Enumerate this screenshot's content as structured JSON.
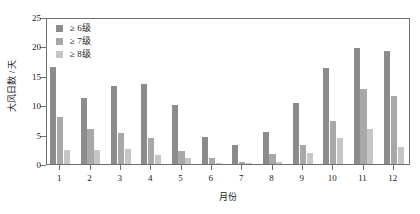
{
  "chart_data": {
    "type": "bar",
    "title": "",
    "xlabel": "月份",
    "ylabel": "大风日数 / 天",
    "categories": [
      "1",
      "2",
      "3",
      "4",
      "5",
      "6",
      "7",
      "8",
      "9",
      "10",
      "11",
      "12"
    ],
    "ylim": [
      0,
      25
    ],
    "yticks": [
      0,
      5,
      10,
      15,
      20,
      25
    ],
    "grid": false,
    "legend_position": "top-left",
    "series": [
      {
        "name": "≥ 6级",
        "color": "#8c8c8c",
        "values": [
          16.5,
          11.2,
          13.2,
          13.6,
          10.0,
          4.6,
          3.2,
          5.5,
          10.4,
          16.3,
          19.7,
          19.2
        ]
      },
      {
        "name": "≥ 7级",
        "color": "#a8a8a8",
        "values": [
          8.0,
          6.0,
          5.3,
          4.5,
          2.2,
          1.1,
          0.3,
          1.7,
          3.2,
          7.3,
          12.7,
          11.5
        ]
      },
      {
        "name": "≥ 8级",
        "color": "#c6c6c6",
        "values": [
          2.3,
          2.4,
          2.5,
          1.6,
          1.0,
          0.2,
          0.1,
          0.4,
          1.8,
          4.4,
          6.0,
          2.9
        ]
      }
    ]
  },
  "axis": {
    "y_tick_labels": [
      "0",
      "5",
      "10",
      "15",
      "20",
      "25"
    ],
    "x_tick_labels": [
      "1",
      "2",
      "3",
      "4",
      "5",
      "6",
      "7",
      "8",
      "9",
      "10",
      "11",
      "12"
    ],
    "y_title": "大风日数 / 天",
    "x_title": "月份"
  },
  "legend": {
    "items": [
      {
        "label": "≥ 6级",
        "color": "#8c8c8c"
      },
      {
        "label": "≥ 7级",
        "color": "#a8a8a8"
      },
      {
        "label": "≥ 8级",
        "color": "#c6c6c6"
      }
    ]
  },
  "style": {
    "axis_color": "#6f6f6f",
    "background": "#ffffff",
    "text_color": "#1a1a1a"
  }
}
